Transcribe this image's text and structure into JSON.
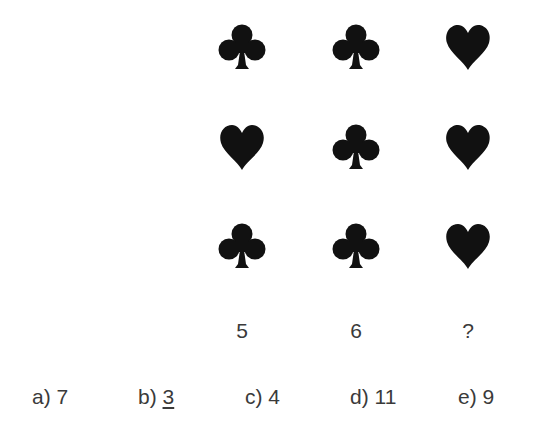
{
  "puzzle": {
    "grid": [
      [
        "club-icon",
        "club-icon",
        "heart-icon"
      ],
      [
        "heart-icon",
        "club-icon",
        "heart-icon"
      ],
      [
        "club-icon",
        "club-icon",
        "heart-icon"
      ]
    ],
    "column_values": [
      "5",
      "6",
      "?"
    ]
  },
  "options": [
    {
      "letter": "a)",
      "value": "7",
      "underlined": false
    },
    {
      "letter": "b)",
      "value": "3",
      "underlined": true
    },
    {
      "letter": "c)",
      "value": "4",
      "underlined": false
    },
    {
      "letter": "d)",
      "value": "11",
      "underlined": false
    },
    {
      "letter": "e)",
      "value": "9",
      "underlined": false
    }
  ],
  "colors": {
    "symbol": "#111111",
    "text": "#3a3a3a",
    "background": "#ffffff"
  }
}
